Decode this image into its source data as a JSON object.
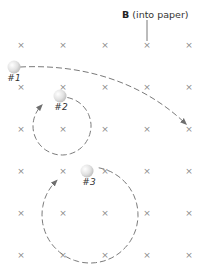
{
  "field": {
    "symbol": "B",
    "description": "(into paper)",
    "pointer_target": {
      "x": 147,
      "y": 45
    }
  },
  "grid": {
    "marker": "×",
    "columns_x": [
      21,
      63,
      105,
      147,
      189
    ],
    "rows_y": [
      45,
      87,
      129,
      171,
      213,
      255
    ],
    "color": "#8a8a8a"
  },
  "particles": [
    {
      "id": "1",
      "label": "#1",
      "x": 14,
      "y": 67,
      "label_x": 14,
      "label_y": 73,
      "path": {
        "type": "arc",
        "d": "M 20 67 C 80 64, 140 80, 186 124",
        "direction": "down-right"
      }
    },
    {
      "id": "2",
      "label": "#2",
      "x": 60,
      "y": 96,
      "label_x": 61,
      "label_y": 102,
      "path": {
        "type": "circle",
        "center": [
          62,
          126
        ],
        "radius": 29,
        "rotation": "clockwise"
      }
    },
    {
      "id": "3",
      "label": "#3",
      "x": 87,
      "y": 171,
      "label_x": 89,
      "label_y": 177,
      "path": {
        "type": "circle",
        "center": [
          90,
          215
        ],
        "radius": 48,
        "rotation": "clockwise"
      }
    }
  ],
  "colors": {
    "path": "#7a7a7a",
    "particle_fill": "#e4e4e4",
    "text": "#333333"
  }
}
